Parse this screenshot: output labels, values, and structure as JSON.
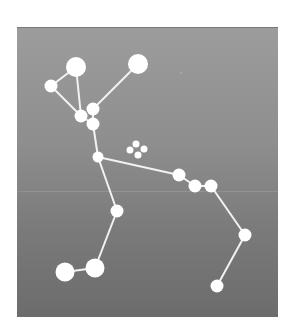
{
  "figure": {
    "colors": {
      "background_top": "#9c9c9c",
      "background_bottom": "#6c6c6c",
      "star": "#ffffff",
      "line": "#f2f2f2",
      "page": "#ffffff"
    }
  },
  "stars": [
    {
      "id": "A",
      "x": 76,
      "y": 67,
      "r": 10
    },
    {
      "id": "B",
      "x": 51,
      "y": 86,
      "r": 6.5
    },
    {
      "id": "C",
      "x": 138,
      "y": 64,
      "r": 10
    },
    {
      "id": "D",
      "x": 93,
      "y": 109,
      "r": 6.5
    },
    {
      "id": "E",
      "x": 81,
      "y": 116,
      "r": 6.5
    },
    {
      "id": "F",
      "x": 93,
      "y": 124,
      "r": 6.5
    },
    {
      "id": "G",
      "x": 98,
      "y": 157,
      "r": 5.5
    },
    {
      "id": "H",
      "x": 179,
      "y": 175,
      "r": 6.5
    },
    {
      "id": "I",
      "x": 195,
      "y": 186,
      "r": 6.5
    },
    {
      "id": "J",
      "x": 211,
      "y": 186,
      "r": 6.5
    },
    {
      "id": "K",
      "x": 245,
      "y": 235,
      "r": 6.5
    },
    {
      "id": "L",
      "x": 117,
      "y": 211,
      "r": 6.5
    },
    {
      "id": "M",
      "x": 95,
      "y": 268,
      "r": 9.5
    },
    {
      "id": "N",
      "x": 65,
      "y": 272,
      "r": 9.5
    },
    {
      "id": "O",
      "x": 217,
      "y": 286,
      "r": 6.5
    }
  ],
  "cluster": [
    {
      "x": 136,
      "y": 144,
      "r": 3.5
    },
    {
      "x": 144,
      "y": 149,
      "r": 3.5
    },
    {
      "x": 130,
      "y": 150,
      "r": 3.5
    },
    {
      "x": 138,
      "y": 155,
      "r": 3.5
    }
  ],
  "lines": [
    [
      "A",
      "B"
    ],
    [
      "B",
      "E"
    ],
    [
      "A",
      "E"
    ],
    [
      "C",
      "D"
    ],
    [
      "E",
      "F"
    ],
    [
      "D",
      "F"
    ],
    [
      "F",
      "G"
    ],
    [
      "G",
      "H"
    ],
    [
      "H",
      "I"
    ],
    [
      "I",
      "J"
    ],
    [
      "J",
      "K"
    ],
    [
      "K",
      "O"
    ],
    [
      "G",
      "L"
    ],
    [
      "L",
      "M"
    ],
    [
      "M",
      "N"
    ]
  ]
}
